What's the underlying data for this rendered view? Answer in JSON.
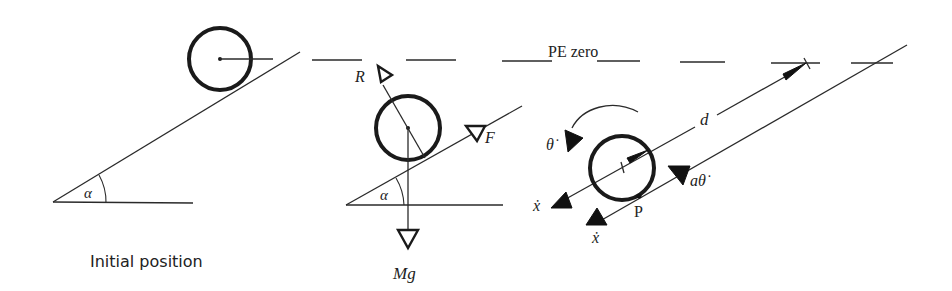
{
  "figure": {
    "panels": [
      {
        "id": "initial",
        "caption": "Initial position",
        "angle_label": "α"
      },
      {
        "id": "forces",
        "force_labels": {
          "reaction": "R",
          "friction": "F",
          "weight": "Mg"
        },
        "angle_label": "α"
      },
      {
        "id": "kinematics",
        "labels": {
          "angular_velocity": "θ̇",
          "distance": "d",
          "contact_velocity": "aθ̇",
          "contact_point": "P",
          "center_velocity": "ẋ",
          "point_velocity": "ẋ"
        }
      }
    ],
    "reference_line": {
      "label": "PE zero",
      "style": "dashed"
    },
    "colors": {
      "ink": "#1a1a1a",
      "background": "#ffffff"
    }
  }
}
